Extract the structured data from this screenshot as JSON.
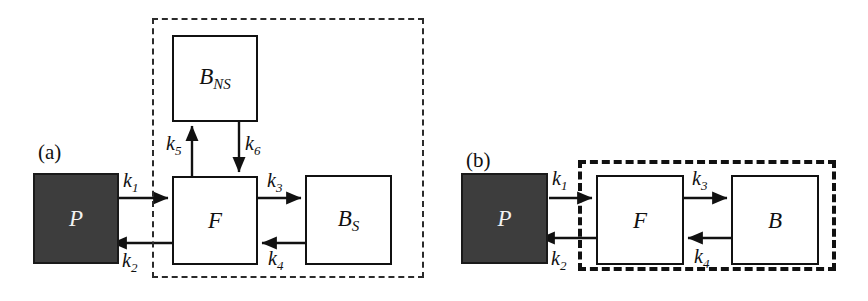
{
  "figure": {
    "panels": [
      {
        "id": "a",
        "label": "(a)",
        "boxes": [
          {
            "name": "precursor",
            "symbol": "P",
            "sub": "",
            "filled": true
          },
          {
            "name": "free",
            "symbol": "F",
            "sub": "",
            "filled": false
          },
          {
            "name": "bound-nonspecific",
            "symbol": "B",
            "sub": "NS",
            "filled": false
          },
          {
            "name": "bound-specific",
            "symbol": "B",
            "sub": "S",
            "filled": false
          }
        ],
        "rates": [
          {
            "name": "k1",
            "symbol": "k",
            "sub": "1"
          },
          {
            "name": "k2",
            "symbol": "k",
            "sub": "2"
          },
          {
            "name": "k3",
            "symbol": "k",
            "sub": "3"
          },
          {
            "name": "k4",
            "symbol": "k",
            "sub": "4"
          },
          {
            "name": "k5",
            "symbol": "k",
            "sub": "5"
          },
          {
            "name": "k6",
            "symbol": "k",
            "sub": "6"
          }
        ]
      },
      {
        "id": "b",
        "label": "(b)",
        "boxes": [
          {
            "name": "precursor",
            "symbol": "P",
            "sub": "",
            "filled": true
          },
          {
            "name": "free",
            "symbol": "F",
            "sub": "",
            "filled": false
          },
          {
            "name": "bound",
            "symbol": "B",
            "sub": "",
            "filled": false
          }
        ],
        "rates": [
          {
            "name": "k1",
            "symbol": "k",
            "sub": "1"
          },
          {
            "name": "k2",
            "symbol": "k",
            "sub": "2"
          },
          {
            "name": "k3",
            "symbol": "k",
            "sub": "3"
          },
          {
            "name": "k4",
            "symbol": "k",
            "sub": "4"
          }
        ]
      }
    ],
    "colors": {
      "plasma_box_fill": "#3d3d3d",
      "line": "#111111",
      "background": "#ffffff"
    }
  },
  "panel_a": {
    "label": "(a)",
    "box_P": {
      "symbol": "P",
      "sub": ""
    },
    "box_F": {
      "symbol": "F",
      "sub": ""
    },
    "box_BNS": {
      "symbol": "B",
      "sub": "NS"
    },
    "box_BS": {
      "symbol": "B",
      "sub": "S"
    },
    "k1": {
      "symbol": "k",
      "sub": "1"
    },
    "k2": {
      "symbol": "k",
      "sub": "2"
    },
    "k3": {
      "symbol": "k",
      "sub": "3"
    },
    "k4": {
      "symbol": "k",
      "sub": "4"
    },
    "k5": {
      "symbol": "k",
      "sub": "5"
    },
    "k6": {
      "symbol": "k",
      "sub": "6"
    }
  },
  "panel_b": {
    "label": "(b)",
    "box_P": {
      "symbol": "P",
      "sub": ""
    },
    "box_F": {
      "symbol": "F",
      "sub": ""
    },
    "box_B": {
      "symbol": "B",
      "sub": ""
    },
    "k1": {
      "symbol": "k",
      "sub": "1"
    },
    "k2": {
      "symbol": "k",
      "sub": "2"
    },
    "k3": {
      "symbol": "k",
      "sub": "3"
    },
    "k4": {
      "symbol": "k",
      "sub": "4"
    }
  }
}
